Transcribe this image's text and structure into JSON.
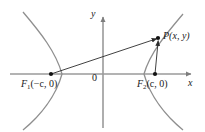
{
  "figure": {
    "type": "hyperbola-diagram",
    "background_color": "#ffffff",
    "curve_color": "#8a8a8a",
    "axis_color": "#9a9a9a",
    "segment_color": "#2b2b2b",
    "point_color": "#111111",
    "width": 205,
    "height": 132
  },
  "axes": {
    "x_label": "x",
    "y_label": "y",
    "origin_label": "0",
    "x_axis_y": 74,
    "y_axis_x": 103,
    "x_axis_start": 10,
    "x_axis_end": 194,
    "y_axis_top": 14,
    "y_axis_bottom": 128
  },
  "points": [
    {
      "name": "F1",
      "label_f": "F",
      "label_sub": "1",
      "label_rest": "(−c, 0)",
      "label": "F₁(−c, 0)",
      "x": 51,
      "y": 74
    },
    {
      "name": "F2",
      "label_f": "F",
      "label_sub": "2",
      "label_rest": "(c, 0)",
      "label": "F₂(c, 0)",
      "x": 155,
      "y": 74
    },
    {
      "name": "P",
      "label_f": "P",
      "label_sub": "",
      "label_rest": "(x, y)",
      "label": "P(x, y)",
      "x": 158,
      "y": 38
    }
  ],
  "labels": {
    "f1_text": "(−c, 0)",
    "f2_text": "(c, 0)",
    "p_text": "(x, y)",
    "f_letter": "F",
    "p_letter": "P",
    "f1_sub": "1",
    "f2_sub": "2"
  },
  "segments": [
    {
      "name": "F1-to-P",
      "from": "F1",
      "to": "P"
    },
    {
      "name": "F2-to-P",
      "from": "F2",
      "to": "P"
    }
  ],
  "branches": [
    {
      "name": "left-branch",
      "opens": "left",
      "vertex_x": 62,
      "vertex_y": 74
    },
    {
      "name": "right-branch",
      "opens": "right",
      "vertex_x": 144,
      "vertex_y": 74
    }
  ]
}
